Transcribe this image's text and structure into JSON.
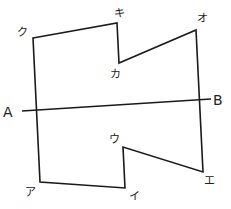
{
  "diagram": {
    "type": "polygon-with-line",
    "stroke_color": "#1a1a1a",
    "polygon": {
      "vertices": [
        {
          "label": "ク",
          "x": 33,
          "y": 38,
          "label_x": 17,
          "label_y": 36
        },
        {
          "label": "キ",
          "x": 117,
          "y": 23,
          "label_x": 114,
          "label_y": 17
        },
        {
          "label": "カ",
          "x": 119,
          "y": 63,
          "label_x": 110,
          "label_y": 78
        },
        {
          "label": "オ",
          "x": 196,
          "y": 30,
          "label_x": 197,
          "label_y": 22
        },
        {
          "label": "エ",
          "x": 203,
          "y": 172,
          "label_x": 204,
          "label_y": 184
        },
        {
          "label": "ウ",
          "x": 123,
          "y": 147,
          "label_x": 109,
          "label_y": 143
        },
        {
          "label": "イ",
          "x": 125,
          "y": 188,
          "label_x": 129,
          "label_y": 200
        },
        {
          "label": "ア",
          "x": 40,
          "y": 182,
          "label_x": 25,
          "label_y": 196
        }
      ]
    },
    "line": {
      "start": {
        "label": "A",
        "x": 22,
        "y": 111,
        "label_x": 3,
        "label_y": 117
      },
      "end": {
        "label": "B",
        "x": 211,
        "y": 99,
        "label_x": 213,
        "label_y": 105
      }
    }
  }
}
